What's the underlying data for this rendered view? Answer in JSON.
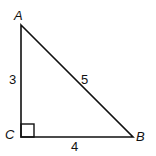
{
  "diagram": {
    "type": "right-triangle",
    "vertices": [
      {
        "label": "A",
        "x": 21,
        "y": 25
      },
      {
        "label": "B",
        "x": 133,
        "y": 137
      },
      {
        "label": "C",
        "x": 21,
        "y": 137
      }
    ],
    "right_angle_at": "C",
    "sides": [
      {
        "between": "A-C",
        "length_label": "3"
      },
      {
        "between": "C-B",
        "length_label": "4"
      },
      {
        "between": "A-B",
        "length_label": "5"
      }
    ],
    "colors": {
      "stroke": "#111111",
      "background": "#ffffff"
    }
  },
  "labels": {
    "vertex_a": "A",
    "vertex_b": "B",
    "vertex_c": "C",
    "side_ac": "3",
    "side_cb": "4",
    "side_ab": "5"
  }
}
